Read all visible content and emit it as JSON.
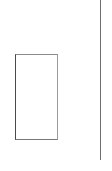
{
  "page": {
    "title": "",
    "background_color": "#ffffff",
    "width": 112,
    "height": 171,
    "text_content": ""
  },
  "shapes": {
    "placeholder_box": {
      "label": "",
      "role": "empty-outlined-rectangle",
      "x": 15,
      "y": 54,
      "width": 43,
      "height": 86,
      "fill_color": "#ffffff",
      "border_color": "#4a4a4a",
      "border_width": 1
    },
    "vertical_divider": {
      "label": "",
      "role": "vertical-rule",
      "x": 100,
      "y": 0,
      "width": 1,
      "height": 160,
      "color": "#6f6f6f"
    }
  },
  "regions": {
    "left_top": {
      "label": ""
    },
    "left_bottom": {
      "label": ""
    },
    "right_margin": {
      "label": ""
    }
  }
}
